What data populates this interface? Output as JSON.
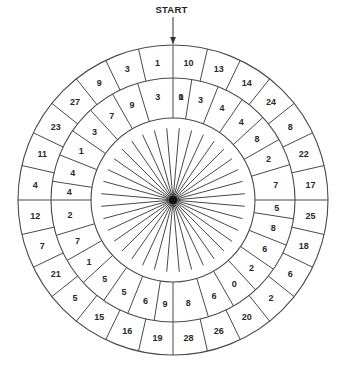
{
  "title": "START",
  "colors": {
    "line": "#4a4a4a",
    "text": "#2a2a2a",
    "hub": "#111111",
    "background": "#ffffff"
  },
  "geometry": {
    "center": [
      173,
      200
    ],
    "outer_radius": 155,
    "middle_radius": 122,
    "inner_radius": 82,
    "spoke_length": 72,
    "spoke_count": 36,
    "segments_per_ring": 28,
    "middle_divider_offset_deg": -4
  },
  "rings": {
    "outer": {
      "direction": "clockwise from START (top)",
      "values": [
        10,
        13,
        14,
        24,
        8,
        22,
        17,
        25,
        18,
        6,
        2,
        20,
        26,
        28,
        19,
        16,
        15,
        5,
        21,
        7,
        12,
        4,
        11,
        23,
        27,
        9,
        3,
        1
      ]
    },
    "middle": {
      "direction": "clockwise from START (top)",
      "values": [
        0,
        3,
        4,
        4,
        8,
        2,
        7,
        5,
        8,
        6,
        2,
        0,
        6,
        8,
        9,
        6,
        5,
        5,
        1,
        7,
        2,
        4,
        4,
        1,
        3,
        7,
        9,
        3,
        1
      ]
    }
  },
  "center_hub": "starburst-spinner"
}
